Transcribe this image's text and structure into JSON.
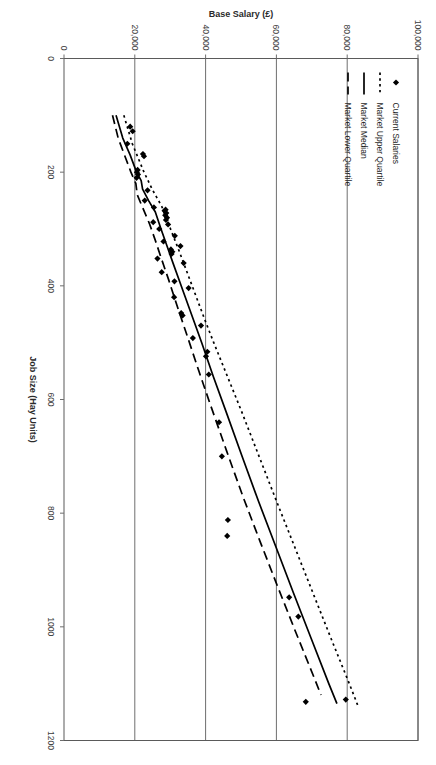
{
  "chart_data": {
    "type": "scatter",
    "title": "",
    "xlabel": "Job Size (Hay Units)",
    "ylabel": "Base Salary (£)",
    "xlim": [
      0,
      1200
    ],
    "ylim": [
      0,
      100000
    ],
    "xticks": [
      0,
      200,
      400,
      600,
      800,
      1000,
      1200
    ],
    "xtick_labels": [
      "0",
      "200",
      "400",
      "600",
      "800",
      "1000",
      "1200"
    ],
    "yticks": [
      0,
      20000,
      40000,
      60000,
      80000,
      100000
    ],
    "ytick_labels": [
      "0",
      "20,000",
      "40,000",
      "60,000",
      "80,000",
      "100,000"
    ],
    "grid": "y-gridlines-only",
    "legend_position": "top-left-inside",
    "rotation_degrees": 90,
    "legend": [
      {
        "label": "Current Salaries",
        "marker": "diamond",
        "style": "scatter",
        "color": "#000000"
      },
      {
        "label": "Market Upper Quartile",
        "marker": "none",
        "style": "dotted-line",
        "color": "#000000"
      },
      {
        "label": "Market Median",
        "marker": "none",
        "style": "solid-line",
        "color": "#000000"
      },
      {
        "label": "Market Lower Quartile",
        "marker": "none",
        "style": "dashed-line",
        "color": "#000000"
      }
    ],
    "series": [
      {
        "name": "Current Salaries",
        "style": "scatter",
        "points": [
          [
            120,
            18700
          ],
          [
            128,
            19400
          ],
          [
            150,
            17900
          ],
          [
            168,
            22300
          ],
          [
            172,
            22600
          ],
          [
            196,
            20800
          ],
          [
            200,
            20600
          ],
          [
            204,
            20900
          ],
          [
            210,
            20500
          ],
          [
            232,
            23600
          ],
          [
            250,
            22800
          ],
          [
            262,
            25400
          ],
          [
            266,
            28700
          ],
          [
            268,
            28400
          ],
          [
            272,
            28900
          ],
          [
            276,
            28600
          ],
          [
            280,
            29100
          ],
          [
            284,
            28800
          ],
          [
            288,
            25200
          ],
          [
            292,
            29400
          ],
          [
            300,
            26900
          ],
          [
            312,
            31300
          ],
          [
            322,
            28100
          ],
          [
            330,
            32900
          ],
          [
            336,
            30200
          ],
          [
            340,
            30600
          ],
          [
            344,
            30400
          ],
          [
            352,
            26400
          ],
          [
            360,
            33800
          ],
          [
            376,
            27600
          ],
          [
            392,
            31200
          ],
          [
            404,
            35200
          ],
          [
            420,
            31100
          ],
          [
            448,
            33100
          ],
          [
            452,
            33500
          ],
          [
            470,
            38700
          ],
          [
            492,
            36400
          ],
          [
            516,
            40500
          ],
          [
            524,
            40100
          ],
          [
            556,
            40900
          ],
          [
            640,
            43800
          ],
          [
            700,
            44600
          ],
          [
            812,
            46300
          ],
          [
            840,
            46100
          ],
          [
            948,
            63600
          ],
          [
            982,
            66200
          ],
          [
            1128,
            79600
          ],
          [
            1132,
            68300
          ]
        ]
      },
      {
        "name": "Market Upper Quartile",
        "style": "dotted-line",
        "points": [
          [
            100,
            16900
          ],
          [
            150,
            19300
          ],
          [
            200,
            22600
          ],
          [
            230,
            24900
          ],
          [
            260,
            27600
          ],
          [
            300,
            30100
          ],
          [
            340,
            32600
          ],
          [
            380,
            35000
          ],
          [
            420,
            37400
          ],
          [
            460,
            39800
          ],
          [
            500,
            42300
          ],
          [
            560,
            46200
          ],
          [
            620,
            50100
          ],
          [
            700,
            55100
          ],
          [
            780,
            60100
          ],
          [
            860,
            65200
          ],
          [
            940,
            70300
          ],
          [
            1020,
            75400
          ],
          [
            1100,
            80600
          ],
          [
            1140,
            83100
          ]
        ]
      },
      {
        "name": "Market Median",
        "style": "solid-line",
        "points": [
          [
            100,
            14700
          ],
          [
            140,
            16600
          ],
          [
            170,
            18700
          ],
          [
            200,
            20500
          ],
          [
            215,
            21800
          ],
          [
            230,
            22200
          ],
          [
            250,
            23900
          ],
          [
            270,
            25800
          ],
          [
            300,
            27400
          ],
          [
            330,
            29100
          ],
          [
            360,
            30800
          ],
          [
            400,
            33100
          ],
          [
            450,
            36000
          ],
          [
            500,
            38900
          ],
          [
            560,
            42200
          ],
          [
            620,
            45700
          ],
          [
            700,
            50300
          ],
          [
            780,
            55000
          ],
          [
            860,
            59900
          ],
          [
            940,
            64800
          ],
          [
            1020,
            69800
          ],
          [
            1100,
            74800
          ],
          [
            1135,
            77100
          ]
        ]
      },
      {
        "name": "Market Lower Quartile",
        "style": "dashed-line",
        "points": [
          [
            100,
            13700
          ],
          [
            140,
            15300
          ],
          [
            175,
            17400
          ],
          [
            200,
            18900
          ],
          [
            220,
            20300
          ],
          [
            240,
            20700
          ],
          [
            265,
            22400
          ],
          [
            290,
            24100
          ],
          [
            320,
            25800
          ],
          [
            350,
            27400
          ],
          [
            390,
            29600
          ],
          [
            440,
            32200
          ],
          [
            490,
            34900
          ],
          [
            550,
            38100
          ],
          [
            610,
            41400
          ],
          [
            690,
            45900
          ],
          [
            770,
            50500
          ],
          [
            850,
            55400
          ],
          [
            930,
            60400
          ],
          [
            1010,
            65500
          ],
          [
            1090,
            70700
          ],
          [
            1120,
            72600
          ]
        ]
      }
    ]
  }
}
